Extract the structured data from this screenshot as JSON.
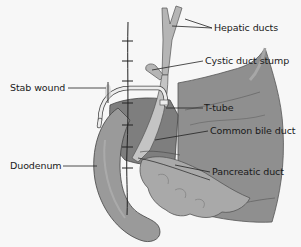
{
  "diagram": {
    "type": "anatomical-illustration",
    "labels": {
      "hepatic_ducts": "Hepatic ducts",
      "cystic_duct_stump": "Cystic duct stump",
      "stab_wound": "Stab wound",
      "t_tube": "T-tube",
      "common_bile_duct": "Common bile duct",
      "duodenum": "Duodenum",
      "pancreatic_duct": "Pancreatic duct"
    },
    "colors": {
      "background": "#f7f7f7",
      "liver": "#8f8f8f",
      "liver_dark": "#6f6f6f",
      "duodenum": "#9a9a9a",
      "pancreas": "#a9a9a9",
      "ducts": "#bdbdbd",
      "tube": "#e6e6e6",
      "outline": "#3a3a3a",
      "label_text": "#1a1a1a"
    }
  }
}
